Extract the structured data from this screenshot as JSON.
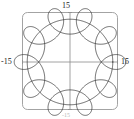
{
  "figure": {
    "background": "#ffffff",
    "frame_color": "#8c8c8c",
    "axis_color": "#8c8c8c",
    "curve_color": "#2b2b2b"
  },
  "labels": {
    "top": "15",
    "left": "-15",
    "right": "15",
    "bottom": "-15"
  },
  "chart_data": {
    "type": "line",
    "title": "",
    "subtitle": "",
    "xlabel": "",
    "ylabel": "",
    "xlim": [
      -15,
      15
    ],
    "ylim": [
      -15,
      15
    ],
    "xticks": [
      -15,
      15
    ],
    "yticks": [
      -15,
      15
    ],
    "xticklabels": [
      "-15",
      "15"
    ],
    "yticklabels": [
      "-15",
      "15"
    ],
    "grid": false,
    "legend": null,
    "axes_style": "centered-cross-with-rounded-frame",
    "aspect": "equal",
    "series": [
      {
        "name": "hypotrochoid",
        "parametric": true,
        "equations": {
          "x": "(R - r) * cos(t) + d * cos(((R - r) / r) * t)",
          "y": "(R - r) * sin(t) - d * sin(((R - r) / r) * t)"
        },
        "parameters": {
          "R": 15,
          "r": 1.5,
          "d": 4.5,
          "loops": 9,
          "t_min": 0,
          "t_max": 6.283185307179586,
          "samples": 1400
        },
        "outer_radius": 15,
        "inner_loop_count": 9,
        "color": "#2b2b2b",
        "linewidth": 0.7
      },
      {
        "name": "bounding-circle",
        "parametric": true,
        "equations": {
          "x": "R * cos(t)",
          "y": "R * sin(t)"
        },
        "parameters": {
          "R": 13.8,
          "t_min": 0,
          "t_max": 6.283185307179586,
          "samples": 400
        },
        "color": "#2b2b2b",
        "linewidth": 0.7
      }
    ],
    "plot_box": {
      "left_px": 22,
      "top_px": 12,
      "right_px": 118,
      "bottom_px": 110,
      "corner_radius_px": 5
    },
    "origin_px": {
      "x": 70,
      "y": 62
    },
    "scale_px_per_unit": 3.1
  }
}
